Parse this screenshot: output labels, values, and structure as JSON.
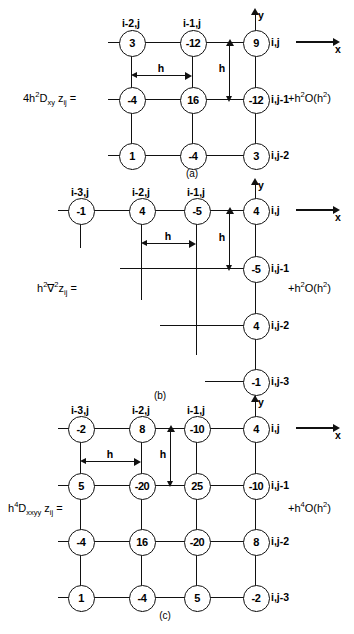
{
  "figure": {
    "panels": [
      {
        "id": "a",
        "caption": "(a)",
        "equation_label": "4h²D_xy z_ij =",
        "equation_parts": {
          "coef": "4h",
          "coef_sup": "2",
          "op": "D",
          "op_sub": "xy",
          "var": "z",
          "var_sub": "ij",
          "eq": "="
        },
        "error_term": "+h²O(h²)",
        "error_parts": {
          "lead": "+h",
          "lead_sup": "2",
          "big": "O(h",
          "big_sup": "2",
          "close": ")"
        },
        "axis": {
          "y_label": "y",
          "x_label": "x"
        },
        "dimension_labels": {
          "horizontal": "h",
          "vertical": "h"
        },
        "column_labels": [
          "i-2,j",
          "i-1,j"
        ],
        "row_labels": [
          "i,j",
          "i,j-1",
          "i,j-2"
        ],
        "rows": [
          {
            "row_label": "i,j",
            "values": [
              "3",
              "-12",
              "9"
            ]
          },
          {
            "row_label": "i,j-1",
            "values": [
              "-4",
              "16",
              "-12"
            ]
          },
          {
            "row_label": "i,j-2",
            "values": [
              "1",
              "-4",
              "3"
            ]
          }
        ]
      },
      {
        "id": "b",
        "caption": "(b)",
        "equation_label": "h²∇²z_ij =",
        "equation_parts": {
          "coef": "h",
          "coef_sup": "2",
          "op": "∇",
          "op_sup": "2",
          "var": "z",
          "var_sub": "ij",
          "eq": "="
        },
        "error_term": "+h²O(h²)",
        "error_parts": {
          "lead": "+h",
          "lead_sup": "2",
          "big": "O(h",
          "big_sup": "2",
          "close": ")"
        },
        "axis": {
          "y_label": "y",
          "x_label": "x"
        },
        "dimension_labels": {
          "horizontal": "h",
          "vertical": "h"
        },
        "column_labels": [
          "i-3,j",
          "i-2,j",
          "i-1,j"
        ],
        "row_labels": [
          "i,j",
          "i,j-1",
          "i,j-2",
          "i,j-3"
        ],
        "rows": [
          {
            "row_label": "i,j",
            "values": [
              "-1",
              "4",
              "-5",
              "4"
            ]
          },
          {
            "row_label": "i,j-1",
            "values": [
              "",
              "",
              "",
              "-5"
            ]
          },
          {
            "row_label": "i,j-2",
            "values": [
              "",
              "",
              "",
              "4"
            ]
          },
          {
            "row_label": "i,j-3",
            "values": [
              "",
              "",
              "",
              "-1"
            ]
          }
        ]
      },
      {
        "id": "c",
        "caption": "(c)",
        "equation_label": "h⁴D_xxyy z_ij =",
        "equation_parts": {
          "coef": "h",
          "coef_sup": "4",
          "op": "D",
          "op_sub": "xxyy",
          "var": "z",
          "var_sub": "ij",
          "eq": "="
        },
        "error_term": "+h⁴O(h²)",
        "error_parts": {
          "lead": "+h",
          "lead_sup": "4",
          "big": "O(h",
          "big_sup": "2",
          "close": ")"
        },
        "axis": {
          "y_label": "y",
          "x_label": "x"
        },
        "dimension_labels": {
          "horizontal": "h",
          "vertical": "h"
        },
        "column_labels": [
          "i-3,j",
          "i-2,j",
          "i-1,j"
        ],
        "row_labels": [
          "i,j",
          "i,j-1",
          "i,j-2",
          "i,j-3"
        ],
        "rows": [
          {
            "row_label": "i,j",
            "values": [
              "-2",
              "8",
              "-10",
              "4"
            ]
          },
          {
            "row_label": "i,j-1",
            "values": [
              "5",
              "-20",
              "25",
              "-10"
            ]
          },
          {
            "row_label": "i,j-2",
            "values": [
              "-4",
              "16",
              "-20",
              "8"
            ]
          },
          {
            "row_label": "i,j-3",
            "values": [
              "1",
              "-4",
              "5",
              "-2"
            ]
          }
        ]
      }
    ]
  }
}
